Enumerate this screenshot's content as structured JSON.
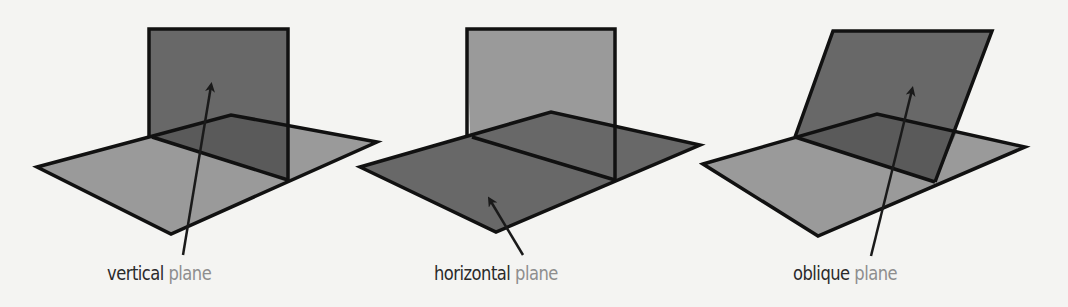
{
  "panels": [
    {
      "label_word1": "vertical",
      "label_word2": "plane"
    },
    {
      "label_word1": "horizontal",
      "label_word2": "plane"
    },
    {
      "label_word1": "oblique",
      "label_word2": "plane"
    }
  ],
  "colors": {
    "background": "#f4f4f2",
    "light_fill": "#9a9a9a",
    "dark_fill": "#686868",
    "overlap_fill": "#5c5c5c",
    "stroke": "#111111",
    "label_dark": "#2a2a2a",
    "label_light": "#8e8e8e"
  }
}
